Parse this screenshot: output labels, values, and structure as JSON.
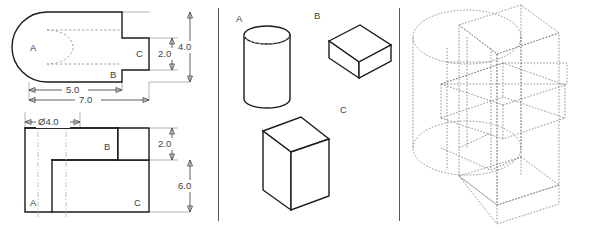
{
  "figure": {
    "panels": [
      {
        "name": "orthographic-views",
        "description": "Top view and front view with dimensions"
      },
      {
        "name": "component-parts",
        "description": "Three isolated solid primitives labeled A, B, C"
      },
      {
        "name": "isometric-assembly",
        "description": "Wireframe isometric assembly of the three primitives"
      }
    ]
  },
  "top_view": {
    "name": "top-view",
    "labels": {
      "a": "A",
      "b": "B",
      "c": "C"
    },
    "dimensions": {
      "width_partial": "5.0",
      "width_total": "7.0",
      "depth_step": "2.0",
      "depth_total": "4.0"
    }
  },
  "front_view": {
    "name": "front-view",
    "labels": {
      "a": "A",
      "b": "B",
      "c": "C"
    },
    "dimensions": {
      "diameter": "Ø4.0",
      "height_step": "2.0",
      "height_total": "6.0"
    }
  },
  "parts": {
    "cylinder": {
      "label": "A",
      "shape": "cylinder"
    },
    "flat_box": {
      "label": "B",
      "shape": "rectangular-prism-flat"
    },
    "plate": {
      "label": "C",
      "shape": "rectangular-prism-plate"
    }
  },
  "assembly": {
    "name": "isometric-assembly",
    "style": "dashed-wireframe"
  },
  "colors": {
    "object_line": "#1b1b1b",
    "hidden_line": "#9aa0a6",
    "center_line": "#b5bbc0",
    "dimension_line": "#4a4f54",
    "divider": "#555b60",
    "background": "#ffffff"
  }
}
